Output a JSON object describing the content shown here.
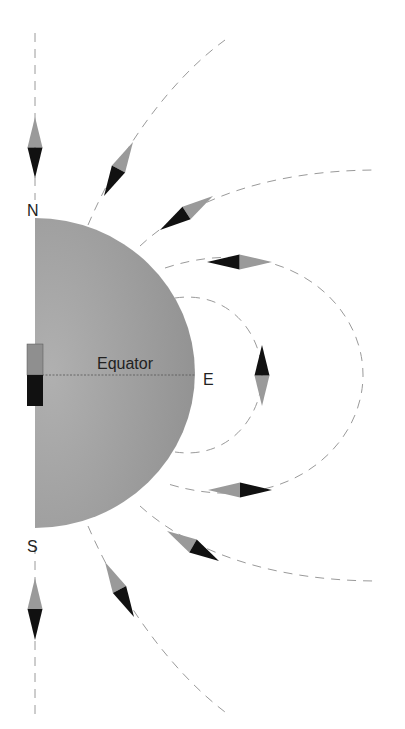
{
  "diagram": {
    "labels": {
      "north": "N",
      "south": "S",
      "east": "E",
      "equator": "Equator"
    },
    "colors": {
      "hemisphere": "#9c9c9c",
      "needle_north_half": "#9a9a9a",
      "needle_south_half": "#111111",
      "field_line": "#9a9a9a",
      "magnet_top": "#8f8f8f",
      "magnet_bottom": "#111111"
    },
    "compass_needles": [
      {
        "id": "needle-top-axis",
        "gray_tip": [
          35,
          117
        ],
        "black_tip": [
          35,
          178
        ]
      },
      {
        "id": "needle-upper-1",
        "gray_tip": [
          133,
          142
        ],
        "black_tip": [
          104,
          196
        ]
      },
      {
        "id": "needle-upper-2",
        "gray_tip": [
          213,
          196
        ],
        "black_tip": [
          160,
          230
        ]
      },
      {
        "id": "needle-upper-3",
        "gray_tip": [
          272,
          262
        ],
        "black_tip": [
          207,
          262
        ]
      },
      {
        "id": "needle-east",
        "gray_tip": [
          262,
          406
        ],
        "black_tip": [
          262,
          345
        ]
      },
      {
        "id": "needle-lower-3",
        "gray_tip": [
          208,
          490
        ],
        "black_tip": [
          272,
          490
        ]
      },
      {
        "id": "needle-lower-2",
        "gray_tip": [
          167,
          531
        ],
        "black_tip": [
          219,
          561
        ]
      },
      {
        "id": "needle-lower-1",
        "gray_tip": [
          105,
          562
        ],
        "black_tip": [
          134,
          617
        ]
      },
      {
        "id": "needle-bottom-axis",
        "gray_tip": [
          35,
          578
        ],
        "black_tip": [
          35,
          640
        ]
      }
    ]
  }
}
